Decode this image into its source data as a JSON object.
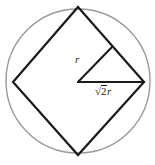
{
  "figure": {
    "kind": "geometry-diagram",
    "width": 155,
    "height": 165,
    "background_color": "#ffffff",
    "circle": {
      "name": "circumscribed-circle",
      "cx": 78,
      "cy": 81,
      "r": 72,
      "stroke_color": "#9a9a9a",
      "stroke_width": 1.4,
      "fill": "none"
    },
    "square": {
      "name": "inscribed-square",
      "stroke_color": "#1a1a1a",
      "stroke_width": 2.2,
      "fill": "none",
      "vertices": [
        {
          "name": "top-vertex",
          "x": 78,
          "y": 7
        },
        {
          "name": "right-vertex",
          "x": 144,
          "y": 82
        },
        {
          "name": "bottom-vertex",
          "x": 78,
          "y": 155
        },
        {
          "name": "left-vertex",
          "x": 13,
          "y": 82
        }
      ]
    },
    "center_point": {
      "name": "circle-center",
      "x": 78,
      "y": 82
    },
    "segments": [
      {
        "name": "radius-segment",
        "from": {
          "x": 78,
          "y": 82
        },
        "to": {
          "x": 112,
          "y": 47
        },
        "stroke_color": "#1a1a1a",
        "stroke_width": 2.0,
        "label": "r"
      },
      {
        "name": "half-diagonal-segment",
        "from": {
          "x": 78,
          "y": 82
        },
        "to": {
          "x": 144,
          "y": 82
        },
        "stroke_color": "#1a1a1a",
        "stroke_width": 2.0,
        "label": "sqrt2r"
      }
    ],
    "labels": {
      "radius": {
        "text": "r",
        "x": 75,
        "y": 54
      },
      "half_diagonal": {
        "radical_symbol": "√",
        "radicand": "2",
        "variable": "r",
        "text": "√2r",
        "x": 95,
        "y": 85
      }
    }
  }
}
